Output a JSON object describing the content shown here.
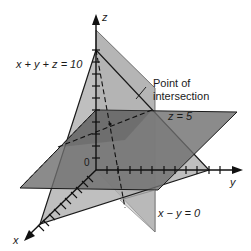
{
  "diagram": {
    "axes": {
      "x_label": "x",
      "y_label": "y",
      "z_label": "z",
      "origin_label": "0"
    },
    "planes": [
      {
        "equation": "x + y + z = 10",
        "fill": "#b8b8b8"
      },
      {
        "equation": "z = 5",
        "fill": "#7a7a7a"
      },
      {
        "equation": "x − y = 0",
        "fill": "#a0a0a0"
      }
    ],
    "annotation": {
      "line1": "Point of",
      "line2": "intersection"
    },
    "colors": {
      "axis": "#111111",
      "edge": "#1a1a1a"
    }
  }
}
